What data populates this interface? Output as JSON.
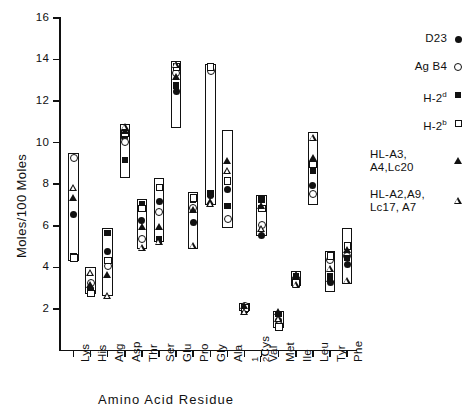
{
  "chart_data": {
    "type": "range-scatter",
    "title": "",
    "xlabel": "Amino Acid Residue",
    "ylabel": "Moles/100 Moles",
    "ylim": [
      0,
      16
    ],
    "ytick_labels": [
      "2",
      "4",
      "6",
      "8",
      "10",
      "12",
      "14",
      "16"
    ],
    "ytick_values": [
      2,
      4,
      6,
      8,
      10,
      12,
      14,
      16
    ],
    "grid": false,
    "legend_position": "right",
    "categories": [
      "Lys",
      "His",
      "Arg",
      "Asp",
      "Thr",
      "Ser",
      "Glu",
      "Pro",
      "Gly",
      "Ala",
      "½Cys",
      "Val",
      "Met",
      "Ile",
      "Leu",
      "Tyr",
      "Phe"
    ],
    "series": [
      {
        "name": "D23",
        "marker": "filled-circle",
        "values": [
          6.6,
          3.0,
          4.8,
          10.3,
          6.3,
          7.2,
          12.5,
          6.2,
          7.5,
          7.8,
          2.1,
          5.6,
          1.5,
          3.4,
          8.0,
          3.3,
          4.2
        ]
      },
      {
        "name": "Ag B4",
        "marker": "open-circle",
        "values": [
          9.3,
          3.3,
          4.1,
          10.1,
          5.4,
          6.7,
          13.4,
          6.9,
          13.5,
          6.4,
          2.2,
          6.1,
          1.3,
          3.5,
          7.6,
          4.4,
          4.6
        ]
      },
      {
        "name": "H-2d",
        "marker": "filled-square",
        "values": [
          4.6,
          2.9,
          5.7,
          9.2,
          7.1,
          5.4,
          12.8,
          7.3,
          7.6,
          7.0,
          2.0,
          7.3,
          1.8,
          3.6,
          8.7,
          3.6,
          4.5
        ]
      },
      {
        "name": "H-2b",
        "marker": "open-square",
        "values": [
          4.5,
          2.8,
          4.4,
          10.5,
          6.9,
          7.9,
          13.7,
          7.4,
          13.7,
          8.2,
          2.1,
          6.9,
          1.2,
          3.3,
          9.0,
          4.6,
          5.1
        ]
      },
      {
        "name": "HL-A3, A4,Lc20",
        "marker": "filled-triangle",
        "values": [
          7.4,
          3.2,
          3.7,
          10.6,
          6.0,
          6.0,
          13.2,
          6.8,
          7.2,
          9.2,
          2.2,
          7.0,
          1.9,
          3.7,
          9.3,
          3.5,
          4.9
        ]
      },
      {
        "name": "HL-A2,A9, Lc17, A7",
        "marker": "open-triangle",
        "values": [
          7.9,
          3.8,
          2.7,
          10.8,
          5.0,
          5.3,
          13.8,
          5.1,
          7.1,
          8.7,
          1.9,
          5.9,
          1.6,
          3.2,
          10.3,
          4.0,
          3.4
        ]
      }
    ],
    "ranges": [
      {
        "category": "Lys",
        "low": 4.3,
        "high": 9.5
      },
      {
        "category": "His",
        "low": 2.7,
        "high": 4.0
      },
      {
        "category": "Arg",
        "low": 2.6,
        "high": 5.9
      },
      {
        "category": "Asp",
        "low": 8.3,
        "high": 10.9
      },
      {
        "category": "Thr",
        "low": 4.9,
        "high": 7.3
      },
      {
        "category": "Ser",
        "low": 5.2,
        "high": 8.3
      },
      {
        "category": "Glu",
        "low": 10.7,
        "high": 13.9
      },
      {
        "category": "Pro",
        "low": 4.9,
        "high": 7.6
      },
      {
        "category": "Gly",
        "low": 7.0,
        "high": 13.8
      },
      {
        "category": "Ala",
        "low": 5.9,
        "high": 10.6
      },
      {
        "category": "½Cys",
        "low": 1.9,
        "high": 2.3
      },
      {
        "category": "Val",
        "low": 5.5,
        "high": 7.5
      },
      {
        "category": "Met",
        "low": 1.1,
        "high": 1.9
      },
      {
        "category": "Ile",
        "low": 3.1,
        "high": 3.8
      },
      {
        "category": "Leu",
        "low": 7.0,
        "high": 10.5
      },
      {
        "category": "Tyr",
        "low": 2.8,
        "high": 4.8
      },
      {
        "category": "Phe",
        "low": 3.2,
        "high": 5.9
      }
    ]
  },
  "axes": {
    "y_label": "Moles/100 Moles",
    "x_label": "Amino Acid Residue",
    "y_ticks": [
      "16",
      "14",
      "12",
      "10",
      "8",
      "6",
      "4",
      "2"
    ],
    "x_ticks": [
      "Lys",
      "His",
      "Arg",
      "Asp",
      "Thr",
      "Ser",
      "Glu",
      "Pro",
      "Gly",
      "Ala",
      "½Cys",
      "Val",
      "Met",
      "Ile",
      "Leu",
      "Tyr",
      "Phe"
    ]
  },
  "legend": {
    "entries": [
      {
        "label": "D23",
        "marker": "filled-circle"
      },
      {
        "label": "Ag B4",
        "marker": "open-circle"
      },
      {
        "label": "H-2",
        "sup": "d",
        "marker": "filled-square"
      },
      {
        "label": "H-2",
        "sup": "b",
        "marker": "open-square"
      },
      {
        "label": "HL-A3,\nA4,Lc20",
        "marker": "filled-triangle"
      },
      {
        "label": "HL-A2,A9,\nLc17, A7",
        "marker": "open-triangle"
      }
    ]
  },
  "colors": {
    "ink": "#111111",
    "background": "#ffffff"
  }
}
